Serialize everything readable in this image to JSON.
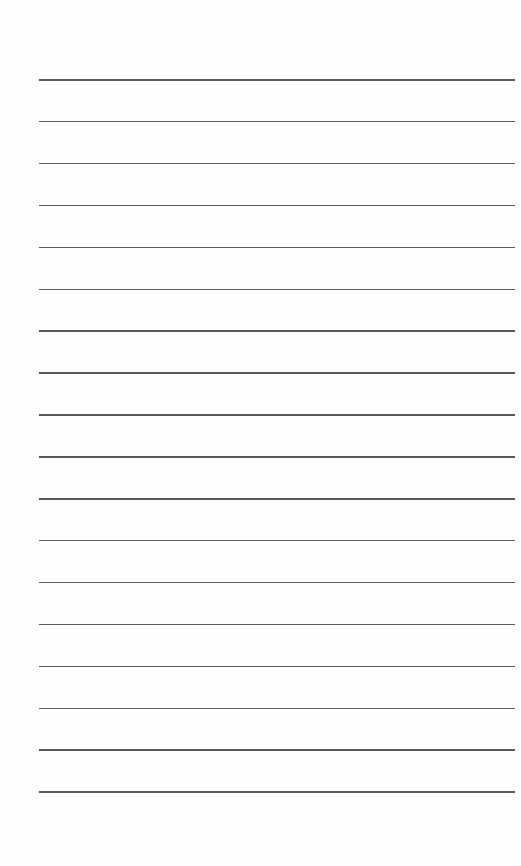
{
  "page": {
    "type": "lined-paper",
    "background_color": "#fefefe",
    "rule_color": "#5a5a5a",
    "rule_count": 18,
    "first_rule_y": 79,
    "rule_spacing": 41.9,
    "rule_left": 39,
    "rule_right": 515,
    "lines": [
      {
        "text": ""
      },
      {
        "text": ""
      },
      {
        "text": ""
      },
      {
        "text": ""
      },
      {
        "text": ""
      },
      {
        "text": ""
      },
      {
        "text": ""
      },
      {
        "text": ""
      },
      {
        "text": ""
      },
      {
        "text": ""
      },
      {
        "text": ""
      },
      {
        "text": ""
      },
      {
        "text": ""
      },
      {
        "text": ""
      },
      {
        "text": ""
      },
      {
        "text": ""
      },
      {
        "text": ""
      },
      {
        "text": ""
      }
    ]
  }
}
